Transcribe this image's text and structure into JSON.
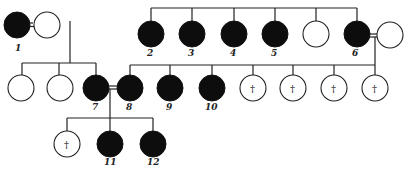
{
  "diagram": {
    "type": "pedigree",
    "colors": {
      "affected": "#0d0d0d",
      "unaffected": "#ffffff",
      "line": "#222222"
    },
    "legend_symbols": {
      "affected": "filled circle",
      "unaffected": "open circle",
      "deceased": "†"
    },
    "individuals": [
      {
        "id": "p1",
        "label": "1",
        "affected": true,
        "deceased": false
      },
      {
        "id": "p1s",
        "label": "",
        "affected": false,
        "deceased": false
      },
      {
        "id": "p2",
        "label": "2",
        "affected": true,
        "deceased": false
      },
      {
        "id": "p3",
        "label": "3",
        "affected": true,
        "deceased": false
      },
      {
        "id": "p4",
        "label": "4",
        "affected": true,
        "deceased": false
      },
      {
        "id": "p5",
        "label": "5",
        "affected": true,
        "deceased": false
      },
      {
        "id": "pu",
        "label": "",
        "affected": false,
        "deceased": false
      },
      {
        "id": "p6",
        "label": "6",
        "affected": true,
        "deceased": false
      },
      {
        "id": "p6s",
        "label": "",
        "affected": false,
        "deceased": false
      },
      {
        "id": "c1a",
        "label": "",
        "affected": false,
        "deceased": false
      },
      {
        "id": "c1b",
        "label": "",
        "affected": false,
        "deceased": false
      },
      {
        "id": "p7",
        "label": "7",
        "affected": true,
        "deceased": false
      },
      {
        "id": "p8",
        "label": "8",
        "affected": true,
        "deceased": false
      },
      {
        "id": "p9",
        "label": "9",
        "affected": true,
        "deceased": false
      },
      {
        "id": "p10",
        "label": "10",
        "affected": true,
        "deceased": false
      },
      {
        "id": "d1",
        "label": "",
        "affected": false,
        "deceased": true,
        "mark": "†"
      },
      {
        "id": "d2",
        "label": "",
        "affected": false,
        "deceased": true,
        "mark": "†"
      },
      {
        "id": "d3",
        "label": "",
        "affected": false,
        "deceased": true,
        "mark": "†"
      },
      {
        "id": "d4",
        "label": "",
        "affected": false,
        "deceased": true,
        "mark": "†"
      },
      {
        "id": "d5",
        "label": "",
        "affected": false,
        "deceased": true,
        "mark": "†"
      },
      {
        "id": "p11",
        "label": "11",
        "affected": true,
        "deceased": false
      },
      {
        "id": "p12",
        "label": "12",
        "affected": true,
        "deceased": false
      }
    ],
    "labels": {
      "n1": "1",
      "n2": "2",
      "n3": "3",
      "n4": "4",
      "n5": "5",
      "n6": "6",
      "n7": "7",
      "n8": "8",
      "n9": "9",
      "n10": "10",
      "n11": "11",
      "n12": "12",
      "dagger": "†"
    }
  }
}
